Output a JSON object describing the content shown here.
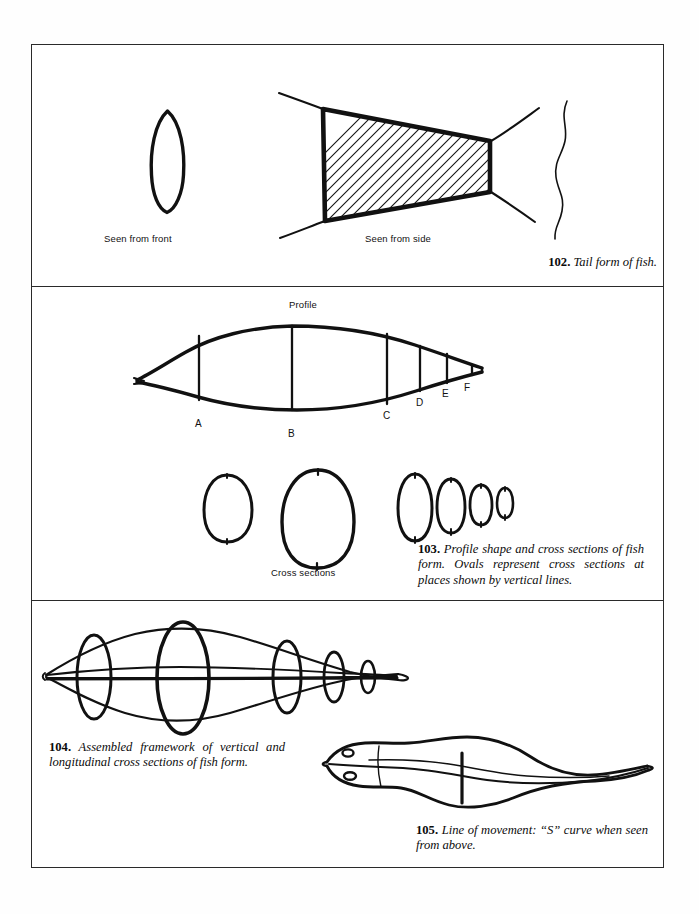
{
  "page": {
    "background": "#ffffff",
    "ink_color": "#111111",
    "border_color": "#2a2a2a",
    "width": 699,
    "height": 914
  },
  "plate": {
    "panels": [
      {
        "id": "panel-1",
        "figure_number": "102"
      },
      {
        "id": "panel-2",
        "figure_number": "103"
      },
      {
        "id": "panel-3",
        "figure_numbers": [
          "104",
          "105"
        ]
      }
    ]
  },
  "figure_102": {
    "labels": {
      "front_view": "Seen from front",
      "side_view": "Seen from side"
    },
    "caption_number": "102.",
    "caption_text": "Tail form of fish."
  },
  "figure_103": {
    "labels": {
      "profile": "Profile",
      "cross_sections": "Cross sections"
    },
    "station_letters": [
      "A",
      "B",
      "C",
      "D",
      "E",
      "F"
    ],
    "caption_number": "103.",
    "caption_text": "Profile shape and cross sections of fish form. Ovals represent cross sections at places shown by vertical lines."
  },
  "figure_104": {
    "caption_number": "104.",
    "caption_text": "Assembled framework of vertical and longitudinal cross sections of fish form."
  },
  "figure_105": {
    "caption_number": "105.",
    "caption_text": "Line of movement: “S” curve when seen from above."
  }
}
